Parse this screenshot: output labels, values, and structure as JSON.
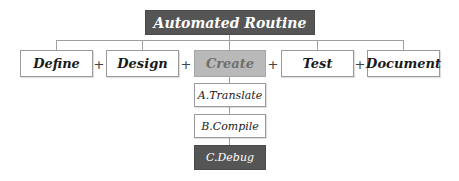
{
  "root": {
    "label": "Automated Routine",
    "color": "#555555"
  },
  "steps": [
    {
      "label": "Define",
      "style": "white"
    },
    {
      "label": "Design",
      "style": "white"
    },
    {
      "label": "Create",
      "style": "gray"
    },
    {
      "label": "Test",
      "style": "white"
    },
    {
      "label": "Document",
      "style": "white"
    }
  ],
  "operator": "+",
  "substeps": [
    {
      "label": "A.Translate",
      "style": "white"
    },
    {
      "label": "B.Compile",
      "style": "white"
    },
    {
      "label": "C.Debug",
      "style": "dark"
    }
  ],
  "colors": {
    "connector": "#a0a0a0",
    "highlight_gray": "#b9b9b9",
    "dark": "#555555"
  }
}
